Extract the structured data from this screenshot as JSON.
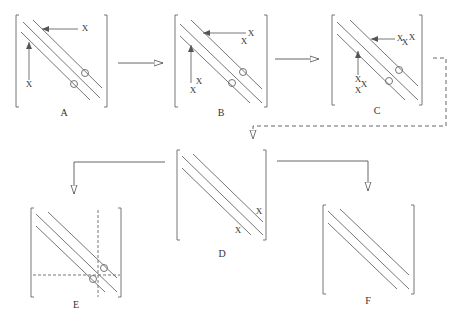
{
  "diagram": {
    "type": "matrix-transformation-flow",
    "matrices": [
      {
        "id": "A",
        "label": "A",
        "fill_marks": [
          "X",
          "X"
        ],
        "circles": 2
      },
      {
        "id": "B",
        "label": "B",
        "fill_marks": [
          "X",
          "X",
          "X",
          "X"
        ],
        "circles": 2
      },
      {
        "id": "C",
        "label": "C",
        "fill_marks": [
          "X",
          "X",
          "X",
          "X",
          "X",
          "X"
        ],
        "circles": 2
      },
      {
        "id": "D",
        "label": "D",
        "fill_marks": [
          "X",
          "X"
        ],
        "circles": 0
      },
      {
        "id": "E",
        "label": "E",
        "fill_marks": [],
        "circles": 2,
        "dashed_partition": true
      },
      {
        "id": "F",
        "label": "F",
        "fill_marks": [],
        "circles": 0
      }
    ],
    "edges": [
      {
        "from": "A",
        "to": "B",
        "style": "solid"
      },
      {
        "from": "B",
        "to": "C",
        "style": "solid"
      },
      {
        "from": "C",
        "to": "D",
        "style": "dashed"
      },
      {
        "from": "D",
        "to": "E",
        "style": "solid"
      },
      {
        "from": "D",
        "to": "F",
        "style": "solid"
      }
    ],
    "mark_symbol": "X",
    "colors": {
      "line": "#555555",
      "band": "#777777",
      "text": "#333333",
      "background": "#ffffff"
    }
  }
}
